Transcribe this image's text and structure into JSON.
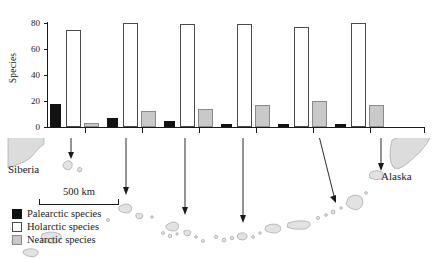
{
  "chart_data": {
    "type": "bar",
    "title": "",
    "xlabel": "",
    "ylabel": "Species",
    "ylim": [
      0,
      80
    ],
    "yticks": [
      0,
      20,
      40,
      60,
      80
    ],
    "grid": false,
    "legend_position": "bottom-left",
    "categories": [
      "1",
      "2",
      "3",
      "4",
      "5",
      "6"
    ],
    "series": [
      {
        "name": "Palearctic species",
        "color": "#121212",
        "values": [
          18,
          7,
          5,
          2,
          2,
          2
        ]
      },
      {
        "name": "Holarctic species",
        "color": "#ffffff",
        "values": [
          75,
          80,
          79,
          79,
          77,
          80
        ]
      },
      {
        "name": "Nearctic species",
        "color": "#c9c9c9",
        "values": [
          3,
          12,
          14,
          17,
          20,
          17
        ]
      }
    ]
  },
  "axis": {
    "y_label": "Species",
    "y_tick_labels": [
      "0",
      "20",
      "40",
      "60",
      "80"
    ]
  },
  "legend": {
    "items": [
      {
        "label": "Palearctic species",
        "swatch": "black"
      },
      {
        "label": "Holarctic species",
        "swatch": "white"
      },
      {
        "label": "Nearctic species",
        "swatch": "gray"
      }
    ]
  },
  "map": {
    "labels": {
      "siberia": "Siberia",
      "alaska": "Alaska"
    }
  },
  "scalebar": {
    "text": "500 km"
  }
}
